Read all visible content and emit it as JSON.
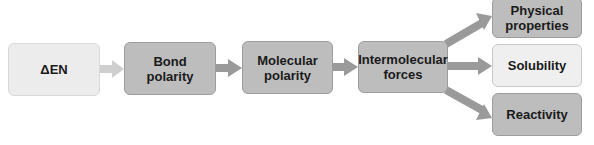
{
  "diagram": {
    "nodes": [
      {
        "id": "delta-en",
        "label": "ΔEN"
      },
      {
        "id": "bond-polarity",
        "label": "Bond\npolarity"
      },
      {
        "id": "molecular-polarity",
        "label": "Molecular\npolarity"
      },
      {
        "id": "intermolecular-forces",
        "label": "Intermolecular\nforces"
      },
      {
        "id": "physical-properties",
        "label": "Physical\nproperties"
      },
      {
        "id": "solubility",
        "label": "Solubility"
      },
      {
        "id": "reactivity",
        "label": "Reactivity"
      }
    ],
    "edges": [
      {
        "from": "delta-en",
        "to": "bond-polarity"
      },
      {
        "from": "bond-polarity",
        "to": "molecular-polarity"
      },
      {
        "from": "molecular-polarity",
        "to": "intermolecular-forces"
      },
      {
        "from": "intermolecular-forces",
        "to": "physical-properties"
      },
      {
        "from": "intermolecular-forces",
        "to": "solubility"
      },
      {
        "from": "intermolecular-forces",
        "to": "reactivity"
      }
    ],
    "colors": {
      "light_box": "#ececec",
      "mid_box": "#bdbdbd",
      "arrow_light": "#cfcfcf",
      "arrow_dark": "#9a9a9a"
    }
  }
}
